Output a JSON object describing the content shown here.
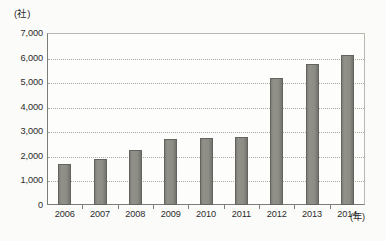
{
  "chart_data": {
    "type": "bar",
    "title": "",
    "subtitle": "",
    "xlabel": "(年)",
    "ylabel": "(社)",
    "categories": [
      "2006",
      "2007",
      "2008",
      "2009",
      "2010",
      "2011",
      "2012",
      "2013",
      "2014"
    ],
    "values": [
      1670,
      1870,
      2240,
      2680,
      2720,
      2780,
      5150,
      5740,
      6100
    ],
    "series": [
      {
        "name": "",
        "values": [
          1670,
          1870,
          2240,
          2680,
          2720,
          2780,
          5150,
          5740,
          6100
        ]
      }
    ],
    "ylim": [
      0,
      7000
    ],
    "ytick_step": 1000,
    "ytick_labels": [
      "0",
      "1,000",
      "2,000",
      "3,000",
      "4,000",
      "5,000",
      "6,000",
      "7,000"
    ],
    "ytick_values": [
      0,
      1000,
      2000,
      3000,
      4000,
      5000,
      6000,
      7000
    ],
    "grid": true,
    "grid_style": "dotted",
    "grid_axis": "y",
    "legend": false,
    "legend_position": "none",
    "bar_color": "#8c8c85",
    "bar_edge_color": "#636360",
    "axis_color": "#7d7d78",
    "background_color": "#fbfbf9",
    "text_color": "#2b2b2b",
    "annotations": []
  },
  "axes": {
    "y_unit": "(社)",
    "x_unit": "(年)"
  }
}
